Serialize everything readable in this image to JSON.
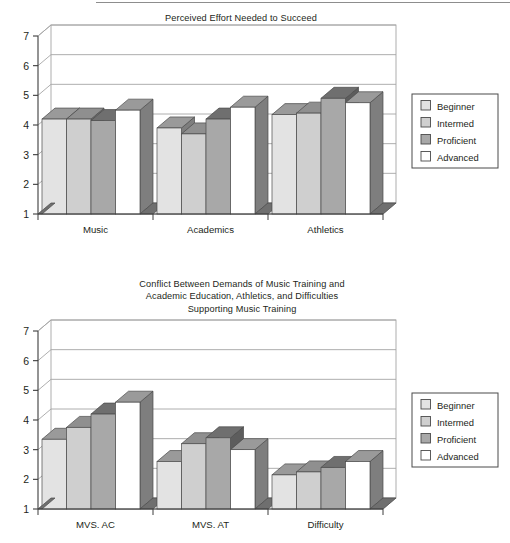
{
  "page": {
    "background_color": "#ffffff",
    "text_color": "#231f20"
  },
  "series_styles": {
    "Beginner": {
      "face": "#e3e3e3",
      "top": "#9a9a9a",
      "side": "#7e7e7e"
    },
    "Intermed": {
      "face": "#cfcfcf",
      "top": "#8f8f8f",
      "side": "#767676"
    },
    "Proficient": {
      "face": "#a8a8a8",
      "top": "#6f6f6f",
      "side": "#5d5d5d"
    },
    "Advanced": {
      "face": "#ffffff",
      "top": "#9a9a9a",
      "side": "#7e7e7e"
    }
  },
  "legend": {
    "items": [
      {
        "label": "Beginner",
        "swatch": "#e3e3e3"
      },
      {
        "label": "Intermed",
        "swatch": "#cfcfcf"
      },
      {
        "label": "Proficient",
        "swatch": "#a8a8a8"
      },
      {
        "label": "Advanced",
        "swatch": "#ffffff"
      }
    ]
  },
  "chart_data": [
    {
      "id": "chart-top",
      "type": "bar",
      "title": "Perceived Effort Needed to Succeed",
      "title_lines": [
        "Perceived Effort Needed to Succeed"
      ],
      "xlabel": "",
      "ylabel": "",
      "ylim": [
        1,
        7
      ],
      "yticks": [
        1,
        2,
        3,
        4,
        5,
        6,
        7
      ],
      "ytick_labels": [
        "1",
        "2",
        "3",
        "4",
        "5",
        "6",
        "7"
      ],
      "grid": true,
      "grid_axis": "y",
      "legend_position": "right",
      "three_d": true,
      "categories": [
        "Music",
        "Academics",
        "Athletics"
      ],
      "series": [
        {
          "name": "Beginner",
          "values": [
            4.2,
            3.9,
            4.35
          ]
        },
        {
          "name": "Intermed",
          "values": [
            4.2,
            3.7,
            4.4
          ]
        },
        {
          "name": "Proficient",
          "values": [
            4.15,
            4.2,
            4.9
          ]
        },
        {
          "name": "Advanced",
          "values": [
            4.5,
            4.6,
            4.75
          ]
        }
      ]
    },
    {
      "id": "chart-bottom",
      "type": "bar",
      "title": "Conflict Between Demands of Music Training and Academic Education, Athletics, and Difficulties Supporting Music Training",
      "title_lines": [
        "Conflict Between Demands of Music Training and",
        "Academic Education, Athletics, and Difficulties",
        "Supporting Music Training"
      ],
      "xlabel": "",
      "ylabel": "",
      "ylim": [
        1,
        7
      ],
      "yticks": [
        1,
        2,
        3,
        4,
        5,
        6,
        7
      ],
      "ytick_labels": [
        "1",
        "2",
        "3",
        "4",
        "5",
        "6",
        "7"
      ],
      "grid": true,
      "grid_axis": "y",
      "legend_position": "right",
      "three_d": true,
      "categories": [
        "MVS. AC",
        "MVS. AT",
        "Difficulty"
      ],
      "series": [
        {
          "name": "Beginner",
          "values": [
            3.35,
            2.6,
            2.15
          ]
        },
        {
          "name": "Intermed",
          "values": [
            3.75,
            3.2,
            2.25
          ]
        },
        {
          "name": "Proficient",
          "values": [
            4.2,
            3.4,
            2.4
          ]
        },
        {
          "name": "Advanced",
          "values": [
            4.6,
            3.0,
            2.6
          ]
        }
      ]
    }
  ]
}
